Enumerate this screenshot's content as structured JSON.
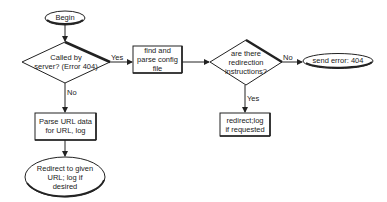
{
  "diagram": {
    "type": "flowchart",
    "colors": {
      "stroke": "#222222",
      "text": "#222222",
      "background": "#ffffff"
    },
    "nodes": [
      {
        "id": "begin",
        "shape": "ellipse",
        "label": "Begin"
      },
      {
        "id": "called_by_server",
        "shape": "diamond",
        "label": "Called by\nserver? (Error 404)"
      },
      {
        "id": "find_parse_config",
        "shape": "rectangle",
        "label": "find and\nparse config\nfile"
      },
      {
        "id": "redirection_instructions",
        "shape": "diamond",
        "label": "are there\nredirection\ninstructions?"
      },
      {
        "id": "send_error",
        "shape": "ellipse",
        "label": "send error: 404"
      },
      {
        "id": "redirect_log",
        "shape": "rectangle",
        "label": "redirect;log\nif requested"
      },
      {
        "id": "parse_url",
        "shape": "rectangle",
        "label": "Parse URL data\nfor URL, log"
      },
      {
        "id": "redirect_given_url",
        "shape": "ellipse",
        "label": "Redirect to given\nURL; log if\ndesired"
      }
    ],
    "edges": [
      {
        "from": "begin",
        "to": "called_by_server",
        "label": ""
      },
      {
        "from": "called_by_server",
        "to": "find_parse_config",
        "label": "Yes"
      },
      {
        "from": "called_by_server",
        "to": "parse_url",
        "label": "No"
      },
      {
        "from": "find_parse_config",
        "to": "redirection_instructions",
        "label": ""
      },
      {
        "from": "redirection_instructions",
        "to": "send_error",
        "label": "No"
      },
      {
        "from": "redirection_instructions",
        "to": "redirect_log",
        "label": "Yes"
      },
      {
        "from": "parse_url",
        "to": "redirect_given_url",
        "label": ""
      }
    ]
  }
}
